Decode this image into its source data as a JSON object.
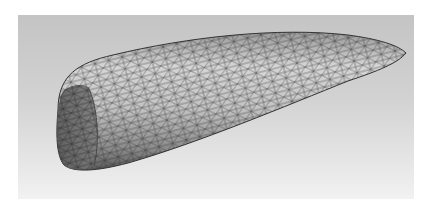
{
  "figure": {
    "background": {
      "top": "#c4c4c4",
      "bottom": "#f2f2f2"
    },
    "mesh": {
      "element_type": "triangle",
      "fill_light": "#d8d8d8",
      "fill_dark": "#6a6a6a",
      "edge_color": "#2a2a2a"
    }
  }
}
